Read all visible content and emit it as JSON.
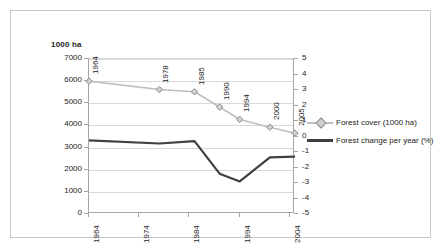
{
  "chart_data": {
    "type": "line",
    "title": "",
    "unit_label": "1000 ha",
    "xlabel": "",
    "ylabel": "",
    "grid": true,
    "legend_position": "right",
    "x": [
      1964,
      1978,
      1985,
      1990,
      1994,
      2000,
      2005
    ],
    "x_axis": {
      "ticks": [
        "1964",
        "1974",
        "1984",
        "1994",
        "2004"
      ],
      "tick_values": [
        1964,
        1974,
        1984,
        1994,
        2004
      ],
      "min": 1964,
      "max": 2005
    },
    "y_axis_left": {
      "label": "1000 ha",
      "ticks": [
        "0",
        "1000",
        "2000",
        "3000",
        "4000",
        "5000",
        "6000",
        "7000"
      ],
      "tick_values": [
        0,
        1000,
        2000,
        3000,
        4000,
        5000,
        6000,
        7000
      ],
      "ylim": [
        0,
        7000
      ]
    },
    "y_axis_right": {
      "label": "%",
      "ticks": [
        "-5",
        "-4",
        "-3",
        "-2",
        "-1",
        "0",
        "1",
        "2",
        "3",
        "4",
        "5"
      ],
      "tick_values": [
        -5,
        -4,
        -3,
        -2,
        -1,
        0,
        1,
        2,
        3,
        4,
        5
      ],
      "ylim": [
        -5,
        5
      ]
    },
    "series": [
      {
        "name": "Forest cover (1000 ha)",
        "axis": "left",
        "color": "#bfbfbf",
        "marker": "diamond",
        "marker_fill": "#d0d0d0",
        "marker_edge": "#8c8c8c",
        "values": [
          6000,
          5620,
          5520,
          4830,
          4270,
          3920,
          3650
        ],
        "point_labels": [
          "1964",
          "1978",
          "1985",
          "1990",
          "1994",
          "2000",
          "2005"
        ]
      },
      {
        "name": "Forest change per year (%)",
        "axis": "right",
        "color": "#404040",
        "marker": "none",
        "values": [
          -0.25,
          -0.45,
          -0.3,
          -2.4,
          -2.9,
          -1.35,
          -1.3
        ]
      }
    ]
  },
  "legend": {
    "items": [
      {
        "label": "Forest cover (1000 ha)"
      },
      {
        "label": "Forest change per year (%)"
      }
    ]
  }
}
